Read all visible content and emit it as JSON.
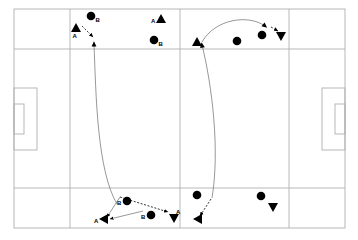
{
  "diagram": {
    "type": "pitch-play-diagram",
    "colors": {
      "background": "#ffffff",
      "pitch_line": "#b0b0b0",
      "marker": "#000000",
      "path_solid": "#6b6b6b",
      "path_dashed": "#000000"
    },
    "pitch": {
      "outline": {
        "x": 14,
        "y": 9,
        "w": 331,
        "h": 219
      },
      "vertical_lines_x": [
        70,
        180,
        289
      ],
      "horizontal_lines_y": [
        49,
        188
      ],
      "left_penalty_box": {
        "x": 14,
        "y": 88,
        "w": 23,
        "h": 62
      },
      "left_goal_box": {
        "x": 14,
        "y": 104,
        "w": 10,
        "h": 30
      },
      "right_penalty_box": {
        "x": 322,
        "y": 88,
        "w": 23,
        "h": 62
      },
      "right_goal_box": {
        "x": 335,
        "y": 104,
        "w": 10,
        "h": 30
      }
    },
    "markers": [
      {
        "id": "m1",
        "shape": "circle",
        "x": 91,
        "y": 16,
        "label": "B",
        "label_pos": "right"
      },
      {
        "id": "m2",
        "shape": "triangle-up",
        "x": 76,
        "y": 28,
        "label": "A",
        "label_pos": "below-left"
      },
      {
        "id": "m3",
        "shape": "triangle-up",
        "x": 161,
        "y": 19,
        "label": "A",
        "label_pos": "left"
      },
      {
        "id": "m4",
        "shape": "circle",
        "x": 154,
        "y": 40,
        "label": "B",
        "label_pos": "right"
      },
      {
        "id": "m5",
        "shape": "triangle-up",
        "x": 197,
        "y": 42,
        "label": "",
        "label_pos": ""
      },
      {
        "id": "m6",
        "shape": "circle",
        "x": 237,
        "y": 41,
        "label": "",
        "label_pos": ""
      },
      {
        "id": "m7",
        "shape": "circle",
        "x": 262,
        "y": 35,
        "label": "",
        "label_pos": ""
      },
      {
        "id": "m8",
        "shape": "triangle-down",
        "x": 281,
        "y": 36,
        "label": "",
        "label_pos": ""
      },
      {
        "id": "m9",
        "shape": "circle",
        "x": 127,
        "y": 201,
        "label": "B",
        "label_pos": "left"
      },
      {
        "id": "m10",
        "shape": "triangle-left",
        "x": 104,
        "y": 219,
        "label": "A",
        "label_pos": "left"
      },
      {
        "id": "m11",
        "shape": "circle",
        "x": 151,
        "y": 215,
        "label": "B",
        "label_pos": "left"
      },
      {
        "id": "m12",
        "shape": "triangle-down",
        "x": 174,
        "y": 218,
        "label": "A",
        "label_pos": "above-right"
      },
      {
        "id": "m13",
        "shape": "circle",
        "x": 197,
        "y": 195,
        "label": "",
        "label_pos": ""
      },
      {
        "id": "m14",
        "shape": "triangle-left",
        "x": 198,
        "y": 219,
        "label": "",
        "label_pos": ""
      },
      {
        "id": "m15",
        "shape": "circle",
        "x": 261,
        "y": 196,
        "label": "",
        "label_pos": ""
      },
      {
        "id": "m16",
        "shape": "triangle-down",
        "x": 273,
        "y": 207,
        "label": "",
        "label_pos": ""
      }
    ],
    "paths": [
      {
        "id": "p1",
        "style": "solid",
        "desc": "left long run up the pitch",
        "d": "M 117 204 C 97 170, 96 95, 94 44"
      },
      {
        "id": "p2",
        "style": "solid",
        "desc": "right long run up the pitch",
        "d": "M 212 198 C 220 150, 212 85, 202 45"
      },
      {
        "id": "p3",
        "style": "solid",
        "desc": "right top curved pass arc",
        "d": "M 202 42 C 215 19, 248 14, 265 26"
      },
      {
        "id": "p4",
        "style": "dashed",
        "desc": "top left short pass",
        "x1": 82,
        "y1": 26,
        "x2": 93,
        "y2": 37
      },
      {
        "id": "p5",
        "style": "dashed",
        "desc": "bottom centre pass right",
        "x1": 120,
        "y1": 197,
        "x2": 168,
        "y2": 212
      },
      {
        "id": "p6",
        "style": "dashed",
        "desc": "top right short pass",
        "x1": 271,
        "y1": 27,
        "x2": 278,
        "y2": 31
      },
      {
        "id": "p7",
        "style": "dashed",
        "desc": "bottom right short pass",
        "x1": 211,
        "y1": 199,
        "x2": 200,
        "y2": 216
      },
      {
        "id": "p8",
        "style": "solid",
        "desc": "bottom left run to wide player",
        "x1": 120,
        "y1": 197,
        "x2": 107,
        "y2": 217
      },
      {
        "id": "p9",
        "style": "solid",
        "desc": "bottom inside pass to wide player",
        "x1": 143,
        "y1": 211,
        "x2": 110,
        "y2": 219
      }
    ]
  }
}
